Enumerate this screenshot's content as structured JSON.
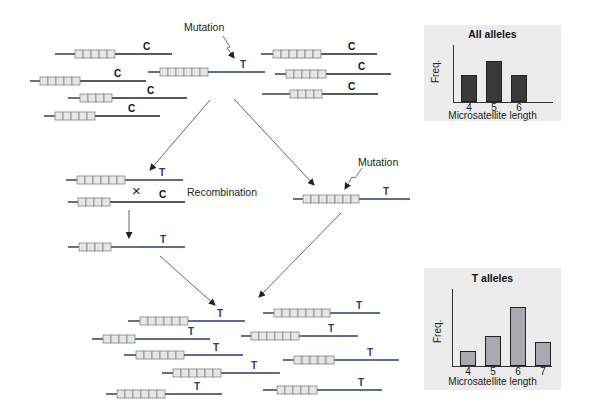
{
  "figure": {
    "labels": {
      "mutation_top": "Mutation",
      "mutation_right": "Mutation",
      "recombination": "Recombination",
      "recombination_mark": "×"
    },
    "colors": {
      "ancestral_line": "#222222",
      "t_line": "#2b3a6b",
      "repeat_box_fill": "#e4e6e8",
      "repeat_box_stroke": "#777777",
      "panel_bg": "#ececec",
      "all_bar_fill": "#3a3a3a",
      "t_bar_fill": "#a8aab0"
    }
  },
  "top_chromosomes": [
    {
      "id": "c1",
      "x0": 55,
      "x1": 172,
      "y": 54,
      "box_x": 75,
      "repeats": 5,
      "allele": "C",
      "allele_x": 143,
      "type": "C"
    },
    {
      "id": "c2",
      "x0": 30,
      "x1": 146,
      "y": 81,
      "box_x": 40,
      "repeats": 5,
      "allele": "C",
      "allele_x": 114,
      "type": "C"
    },
    {
      "id": "c3",
      "x0": 68,
      "x1": 187,
      "y": 98,
      "box_x": 80,
      "repeats": 4,
      "allele": "C",
      "allele_x": 147,
      "type": "C"
    },
    {
      "id": "c4",
      "x0": 44,
      "x1": 160,
      "y": 116,
      "box_x": 55,
      "repeats": 5,
      "allele": "C",
      "allele_x": 128,
      "type": "C"
    },
    {
      "id": "m1",
      "x0": 148,
      "x1": 265,
      "y": 72,
      "box_x": 160,
      "repeats": 6,
      "allele": "T",
      "allele_x": 240,
      "type": "T"
    },
    {
      "id": "c5",
      "x0": 261,
      "x1": 377,
      "y": 54,
      "box_x": 273,
      "repeats": 6,
      "allele": "C",
      "allele_x": 348,
      "type": "C"
    },
    {
      "id": "c6",
      "x0": 275,
      "x1": 391,
      "y": 74,
      "box_x": 286,
      "repeats": 5,
      "allele": "C",
      "allele_x": 358,
      "type": "C"
    },
    {
      "id": "c7",
      "x0": 262,
      "x1": 378,
      "y": 94,
      "box_x": 290,
      "repeats": 4,
      "allele": "C",
      "allele_x": 348,
      "type": "C"
    }
  ],
  "middle_chromosomes": [
    {
      "id": "r1",
      "x0": 66,
      "x1": 183,
      "y": 180,
      "box_x": 77,
      "repeats": 6,
      "allele": "T",
      "allele_x": 159,
      "type": "T"
    },
    {
      "id": "r2",
      "x0": 68,
      "x1": 185,
      "y": 202,
      "box_x": 78,
      "repeats": 4,
      "allele": "C",
      "allele_x": 159,
      "type": "C",
      "mixed": false
    },
    {
      "id": "rec",
      "x0": 68,
      "x1": 185,
      "y": 247,
      "box_x": 79,
      "repeats": 4,
      "allele": "T",
      "allele_x": 160,
      "type": "T",
      "split_x": 140
    },
    {
      "id": "m2",
      "x0": 293,
      "x1": 410,
      "y": 199,
      "box_x": 303,
      "repeats": 7,
      "allele": "T",
      "allele_x": 383,
      "type": "T"
    }
  ],
  "bottom_chromosomes": [
    {
      "x0": 128,
      "x1": 245,
      "y": 321,
      "box_x": 140,
      "repeats": 6,
      "allele": "T",
      "allele_x": 217,
      "type": "T"
    },
    {
      "x0": 92,
      "x1": 210,
      "y": 339,
      "box_x": 103,
      "repeats": 4,
      "allele": "T",
      "allele_x": 188,
      "type": "T"
    },
    {
      "x0": 124,
      "x1": 243,
      "y": 355,
      "box_x": 136,
      "repeats": 6,
      "allele": "T",
      "allele_x": 213,
      "type": "T"
    },
    {
      "x0": 162,
      "x1": 280,
      "y": 373,
      "box_x": 173,
      "repeats": 6,
      "allele": "T",
      "allele_x": 251,
      "type": "T"
    },
    {
      "x0": 106,
      "x1": 222,
      "y": 394,
      "box_x": 117,
      "repeats": 6,
      "allele": "T",
      "allele_x": 194,
      "type": "T"
    },
    {
      "x0": 263,
      "x1": 380,
      "y": 313,
      "box_x": 274,
      "repeats": 7,
      "allele": "T",
      "allele_x": 356,
      "type": "T"
    },
    {
      "x0": 241,
      "x1": 358,
      "y": 336,
      "box_x": 251,
      "repeats": 6,
      "allele": "T",
      "allele_x": 328,
      "type": "T"
    },
    {
      "x0": 283,
      "x1": 399,
      "y": 360,
      "box_x": 294,
      "repeats": 5,
      "allele": "T",
      "allele_x": 367,
      "type": "T"
    },
    {
      "x0": 263,
      "x1": 382,
      "y": 390,
      "box_x": 277,
      "repeats": 5,
      "allele": "T",
      "allele_x": 358,
      "type": "T"
    }
  ],
  "chart_data": [
    {
      "type": "bar",
      "title": "All alleles",
      "xlabel": "Microsatellite length",
      "ylabel": "Freq.",
      "categories": [
        "4",
        "5",
        "6"
      ],
      "values": [
        2,
        3,
        2
      ],
      "ylim": [
        0,
        4.2
      ],
      "grid": false,
      "bar_color": "#3a3a3a"
    },
    {
      "type": "bar",
      "title": "T alleles",
      "xlabel": "Microsatellite length",
      "ylabel": "Freq.",
      "categories": [
        "4",
        "5",
        "6",
        "7"
      ],
      "values": [
        1,
        2,
        4,
        1.6
      ],
      "ylim": [
        0,
        5.2
      ],
      "grid": false,
      "bar_color": "#a8aab0"
    }
  ]
}
